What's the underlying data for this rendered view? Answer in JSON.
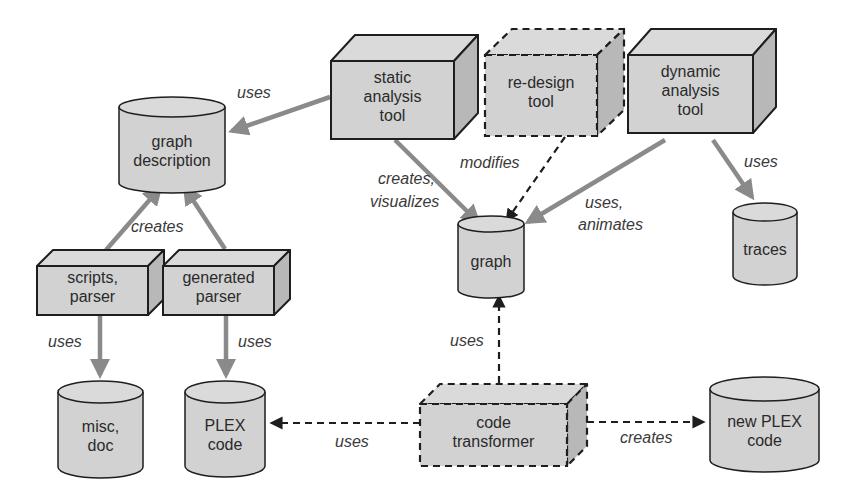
{
  "colors": {
    "background": "#ffffff",
    "shape_fill": "#d2d2d2",
    "shape_top": "#dadada",
    "shape_side": "#b8b8b8",
    "outline": "#1e1e1e",
    "solid_arrow": "#8a8a8a",
    "dashed_arrow": "#1e1e1e"
  },
  "nodes": {
    "graph_description": {
      "type": "datastore",
      "lines": [
        "graph",
        "description"
      ]
    },
    "static_analysis_tool": {
      "type": "tool",
      "style": "solid",
      "lines": [
        "static",
        "analysis",
        "tool"
      ]
    },
    "redesign_tool": {
      "type": "tool",
      "style": "dashed",
      "lines": [
        "re-design",
        "tool"
      ]
    },
    "dynamic_analysis_tool": {
      "type": "tool",
      "style": "solid",
      "lines": [
        "dynamic",
        "analysis",
        "tool"
      ]
    },
    "graph": {
      "type": "datastore",
      "lines": [
        "graph"
      ]
    },
    "traces": {
      "type": "datastore",
      "lines": [
        "traces"
      ]
    },
    "scripts_parser": {
      "type": "tool",
      "style": "solid",
      "lines": [
        "scripts,",
        "parser"
      ]
    },
    "generated_parser": {
      "type": "tool",
      "style": "solid",
      "lines": [
        "generated",
        "parser"
      ]
    },
    "misc_doc": {
      "type": "datastore",
      "lines": [
        "misc,",
        "doc"
      ]
    },
    "plex_code": {
      "type": "datastore",
      "lines": [
        "PLEX",
        "code"
      ]
    },
    "code_transformer": {
      "type": "tool",
      "style": "dashed",
      "lines": [
        "code",
        "transformer"
      ]
    },
    "new_plex_code": {
      "type": "datastore",
      "lines": [
        "new PLEX",
        "code"
      ]
    }
  },
  "edges": [
    {
      "from": "static_analysis_tool",
      "to": "graph_description",
      "style": "solid",
      "label": [
        "uses"
      ]
    },
    {
      "from": "scripts_parser",
      "to": "graph_description",
      "style": "solid",
      "label": [
        "creates"
      ]
    },
    {
      "from": "generated_parser",
      "to": "graph_description",
      "style": "solid",
      "label": []
    },
    {
      "from": "static_analysis_tool",
      "to": "graph",
      "style": "solid",
      "label": [
        "creates,",
        "visualizes"
      ]
    },
    {
      "from": "redesign_tool",
      "to": "graph",
      "style": "dashed",
      "label": [
        "modifies"
      ]
    },
    {
      "from": "dynamic_analysis_tool",
      "to": "graph",
      "style": "solid",
      "label": [
        "uses,",
        "animates"
      ]
    },
    {
      "from": "dynamic_analysis_tool",
      "to": "traces",
      "style": "solid",
      "label": [
        "uses"
      ]
    },
    {
      "from": "scripts_parser",
      "to": "misc_doc",
      "style": "solid",
      "label": [
        "uses"
      ]
    },
    {
      "from": "generated_parser",
      "to": "plex_code",
      "style": "solid",
      "label": [
        "uses"
      ]
    },
    {
      "from": "code_transformer",
      "to": "graph",
      "style": "dashed",
      "label": [
        "uses"
      ]
    },
    {
      "from": "code_transformer",
      "to": "plex_code",
      "style": "dashed",
      "label": [
        "uses"
      ]
    },
    {
      "from": "code_transformer",
      "to": "new_plex_code",
      "style": "dashed",
      "label": [
        "creates"
      ]
    }
  ]
}
